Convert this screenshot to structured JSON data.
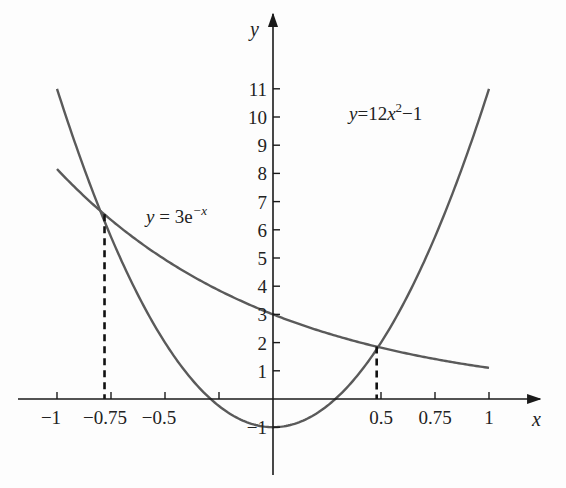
{
  "chart_data": {
    "type": "line",
    "title": "",
    "xlabel": "x",
    "ylabel": "y",
    "xlim": [
      -1.1,
      1.2
    ],
    "ylim": [
      -2.5,
      13.5
    ],
    "grid": false,
    "legend": "inline annotations",
    "x_ticks": [
      -1,
      -0.75,
      -0.5,
      -0.25,
      0.5,
      0.75,
      1
    ],
    "x_tick_labels": [
      "−1",
      "−0.75",
      "−0.5",
      "",
      "0.5",
      "0.75",
      "1"
    ],
    "y_ticks": [
      -1,
      1,
      2,
      3,
      4,
      5,
      6,
      7,
      8,
      9,
      10,
      11
    ],
    "y_tick_labels": [
      "−1",
      "1",
      "2",
      "3",
      "4",
      "5",
      "6",
      "7",
      "8",
      "9",
      "10",
      "11"
    ],
    "series": [
      {
        "name": "y = 12x² − 1",
        "label_parts": [
          "y",
          "=12",
          "x",
          "2",
          "−1"
        ],
        "expression": "12*x^2 - 1",
        "x_range": [
          -1,
          1
        ],
        "x": [
          -1,
          -0.75,
          -0.5,
          -0.25,
          0,
          0.25,
          0.5,
          0.75,
          1
        ],
        "values": [
          11,
          5.75,
          2,
          -0.25,
          -1,
          -0.25,
          2,
          5.75,
          11
        ],
        "color": "#5a5a5a"
      },
      {
        "name": "y = 3e^(−x)",
        "label_parts": [
          "y",
          "= 3e",
          "−x"
        ],
        "expression": "3*exp(-x)",
        "x_range": [
          -1,
          1
        ],
        "x": [
          -1,
          -0.75,
          -0.5,
          -0.25,
          0,
          0.25,
          0.5,
          0.75,
          1
        ],
        "values": [
          8.15,
          6.35,
          4.95,
          3.85,
          3,
          2.34,
          1.82,
          1.42,
          1.1
        ],
        "color": "#5a5a5a"
      }
    ],
    "annotations": [
      {
        "type": "intersection-dropline",
        "x": -0.78,
        "y": 6.55
      },
      {
        "type": "intersection-dropline",
        "x": 0.48,
        "y": 1.86
      }
    ]
  },
  "labels": {
    "x_axis": "x",
    "y_axis": "y",
    "parabola": {
      "y": "y",
      "eq": "=12",
      "x": "x",
      "exp": "2",
      "tail": "−1"
    },
    "exponential": {
      "y": "y",
      "eq": " = 3e",
      "exp": "−x"
    }
  },
  "colors": {
    "background": "#fdfdfd",
    "axis": "#1a1a1a",
    "curve": "#5a5a5a",
    "dropline": "#111111"
  }
}
